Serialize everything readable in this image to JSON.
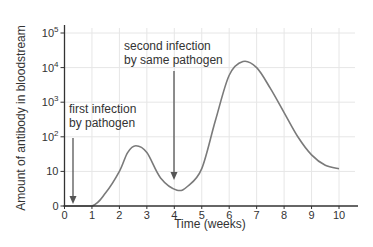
{
  "chart_data": {
    "type": "line",
    "title": "",
    "xlabel": "Time (weeks)",
    "ylabel": "Amount of antibody in bloodstream",
    "xlim": [
      0,
      10
    ],
    "x_ticks": [
      "0",
      "1",
      "2",
      "3",
      "4",
      "5",
      "6",
      "7",
      "8",
      "9",
      "10"
    ],
    "y_scale": "log",
    "y_ticks": [
      {
        "label": "0",
        "base": "",
        "exp": "",
        "value": 0
      },
      {
        "label": "10",
        "base": "",
        "exp": "",
        "value": 10
      },
      {
        "label": "10^2",
        "base": "10",
        "exp": "2",
        "value": 100
      },
      {
        "label": "10^3",
        "base": "10",
        "exp": "3",
        "value": 1000
      },
      {
        "label": "10^4",
        "base": "10",
        "exp": "4",
        "value": 10000
      },
      {
        "label": "10^5",
        "base": "10",
        "exp": "5",
        "value": 100000
      }
    ],
    "grid": true,
    "series": [
      {
        "name": "Antibody level",
        "x": [
          0,
          1,
          1.5,
          2,
          2.3,
          2.6,
          3,
          3.5,
          4.1,
          4.5,
          5,
          5.5,
          6,
          6.5,
          7,
          7.5,
          8,
          8.5,
          9,
          9.5,
          10
        ],
        "values": [
          0,
          0,
          1.5,
          10,
          35,
          55,
          35,
          6,
          2,
          3,
          12,
          300,
          6000,
          15000,
          10000,
          2500,
          500,
          100,
          30,
          15,
          12
        ]
      }
    ],
    "annotations": [
      {
        "lines": [
          "first infection",
          "by pathogen"
        ],
        "x": 0.3,
        "arrow_to_value": 0
      },
      {
        "lines": [
          "second infection",
          "by same pathogen"
        ],
        "x": 4.0,
        "arrow_to_value": 2
      }
    ]
  },
  "colors": {
    "curve": "#7a7a7a",
    "axis": "#333333",
    "grid": "#e6e6e6",
    "arrow": "#555555",
    "text": "#333333"
  }
}
